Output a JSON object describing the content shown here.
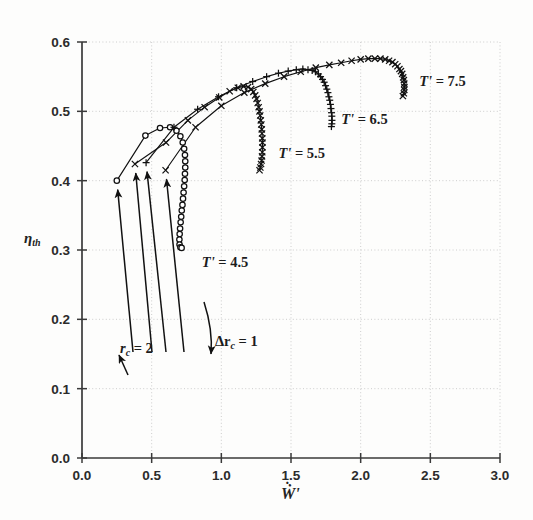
{
  "figure": {
    "background": "#fdfdfc",
    "axis_color": "#3a3a3a",
    "grid_color": "#c8c8c8",
    "curve_color": "#111111"
  },
  "axes": {
    "x_title": "Ẇ'",
    "y_title": "η",
    "y_title_sub": "th",
    "x_ticks": [
      "0.0",
      "0.5",
      "1.0",
      "1.5",
      "2.0",
      "2.5",
      "3.0"
    ],
    "y_ticks": [
      "0.0",
      "0.1",
      "0.2",
      "0.3",
      "0.4",
      "0.5",
      "0.6"
    ],
    "xlim": [
      0.0,
      3.0
    ],
    "ylim": [
      0.0,
      0.6
    ]
  },
  "annotations": {
    "rc_start": "r",
    "rc_start_sub": "c",
    "rc_start_val": "= 2",
    "drc": "Δr",
    "drc_sub": "c",
    "drc_val": "= 1"
  },
  "chart_data": {
    "type": "line",
    "title": "",
    "xlabel": "Ẇ'",
    "ylabel": "η_th",
    "xlim": [
      0.0,
      3.0
    ],
    "ylim": [
      0.0,
      0.6
    ],
    "xticks": [
      0.0,
      0.5,
      1.0,
      1.5,
      2.0,
      2.5,
      3.0
    ],
    "yticks": [
      0.0,
      0.1,
      0.2,
      0.3,
      0.4,
      0.5,
      0.6
    ],
    "grid": true,
    "legend": "inline curve labels",
    "annotations": [
      {
        "text": "r_c = 2",
        "x": 0.42,
        "y": 0.345,
        "note": "arrows point to the first point of each curve"
      },
      {
        "text": "Δr_c = 1",
        "x": 0.99,
        "y": 0.355,
        "note": "curved arrow showing direction of increasing r_c"
      }
    ],
    "series": [
      {
        "name": "T' = 4.5",
        "label": "T' = 4.5",
        "label_x": 0.86,
        "label_y": 0.275,
        "marker": "circle",
        "points": [
          [
            0.25,
            0.4
          ],
          [
            0.455,
            0.465
          ],
          [
            0.56,
            0.476
          ],
          [
            0.632,
            0.477
          ],
          [
            0.678,
            0.472
          ],
          [
            0.706,
            0.464
          ],
          [
            0.723,
            0.455
          ],
          [
            0.733,
            0.446
          ],
          [
            0.739,
            0.437
          ],
          [
            0.741,
            0.428
          ],
          [
            0.741,
            0.419
          ],
          [
            0.739,
            0.41
          ],
          [
            0.737,
            0.401
          ],
          [
            0.733,
            0.392
          ],
          [
            0.729,
            0.383
          ],
          [
            0.725,
            0.374
          ],
          [
            0.721,
            0.365
          ],
          [
            0.716,
            0.357
          ],
          [
            0.712,
            0.348
          ],
          [
            0.708,
            0.34
          ],
          [
            0.704,
            0.331
          ],
          [
            0.701,
            0.323
          ],
          [
            0.699,
            0.315
          ],
          [
            0.7,
            0.308
          ],
          [
            0.706,
            0.304
          ],
          [
            0.715,
            0.303
          ]
        ]
      },
      {
        "name": "T' = 5.5",
        "label": "T' = 5.5",
        "label_x": 1.41,
        "label_y": 0.433,
        "marker": "x",
        "points": [
          [
            0.38,
            0.424
          ],
          [
            0.603,
            0.455
          ],
          [
            0.76,
            0.487
          ],
          [
            0.88,
            0.506
          ],
          [
            0.985,
            0.52
          ],
          [
            1.06,
            0.529
          ],
          [
            1.118,
            0.534
          ],
          [
            1.16,
            0.536
          ],
          [
            1.192,
            0.535
          ],
          [
            1.214,
            0.532
          ],
          [
            1.23,
            0.528
          ],
          [
            1.243,
            0.523
          ],
          [
            1.253,
            0.518
          ],
          [
            1.261,
            0.512
          ],
          [
            1.268,
            0.506
          ],
          [
            1.274,
            0.5
          ],
          [
            1.279,
            0.494
          ],
          [
            1.283,
            0.487
          ],
          [
            1.287,
            0.481
          ],
          [
            1.29,
            0.474
          ],
          [
            1.292,
            0.468
          ],
          [
            1.294,
            0.461
          ],
          [
            1.295,
            0.455
          ],
          [
            1.295,
            0.448
          ],
          [
            1.294,
            0.441
          ],
          [
            1.292,
            0.435
          ],
          [
            1.289,
            0.429
          ],
          [
            1.285,
            0.424
          ],
          [
            1.28,
            0.419
          ],
          [
            1.274,
            0.415
          ]
        ]
      },
      {
        "name": "T' = 6.5",
        "label": "T' = 6.5",
        "label_x": 1.86,
        "label_y": 0.482,
        "marker": "plus",
        "points": [
          [
            0.46,
            0.426
          ],
          [
            0.66,
            0.477
          ],
          [
            0.83,
            0.503
          ],
          [
            0.98,
            0.521
          ],
          [
            1.11,
            0.534
          ],
          [
            1.225,
            0.543
          ],
          [
            1.325,
            0.55
          ],
          [
            1.41,
            0.555
          ],
          [
            1.48,
            0.558
          ],
          [
            1.538,
            0.56
          ],
          [
            1.585,
            0.561
          ],
          [
            1.622,
            0.56
          ],
          [
            1.652,
            0.559
          ],
          [
            1.676,
            0.557
          ],
          [
            1.696,
            0.554
          ],
          [
            1.712,
            0.55
          ],
          [
            1.726,
            0.546
          ],
          [
            1.738,
            0.542
          ],
          [
            1.748,
            0.537
          ],
          [
            1.757,
            0.532
          ],
          [
            1.765,
            0.527
          ],
          [
            1.772,
            0.521
          ],
          [
            1.778,
            0.516
          ],
          [
            1.783,
            0.51
          ],
          [
            1.787,
            0.504
          ],
          [
            1.791,
            0.498
          ],
          [
            1.793,
            0.493
          ],
          [
            1.794,
            0.487
          ],
          [
            1.793,
            0.482
          ],
          [
            1.79,
            0.478
          ]
        ]
      },
      {
        "name": "T' = 7.5",
        "label": "T' = 7.5",
        "label_x": 2.42,
        "label_y": 0.537,
        "marker": "x",
        "points": [
          [
            0.6,
            0.415
          ],
          [
            0.815,
            0.477
          ],
          [
            1.0,
            0.508
          ],
          [
            1.165,
            0.527
          ],
          [
            1.315,
            0.54
          ],
          [
            1.45,
            0.55
          ],
          [
            1.57,
            0.557
          ],
          [
            1.678,
            0.563
          ],
          [
            1.775,
            0.567
          ],
          [
            1.86,
            0.57
          ],
          [
            1.935,
            0.573
          ],
          [
            2.0,
            0.575
          ],
          [
            2.055,
            0.576
          ],
          [
            2.102,
            0.576
          ],
          [
            2.142,
            0.576
          ],
          [
            2.176,
            0.575
          ],
          [
            2.204,
            0.573
          ],
          [
            2.228,
            0.571
          ],
          [
            2.248,
            0.568
          ],
          [
            2.264,
            0.565
          ],
          [
            2.278,
            0.561
          ],
          [
            2.289,
            0.558
          ],
          [
            2.298,
            0.554
          ],
          [
            2.305,
            0.549
          ],
          [
            2.31,
            0.545
          ],
          [
            2.313,
            0.54
          ],
          [
            2.314,
            0.535
          ],
          [
            2.313,
            0.531
          ],
          [
            2.31,
            0.526
          ],
          [
            2.303,
            0.522
          ]
        ]
      }
    ]
  }
}
